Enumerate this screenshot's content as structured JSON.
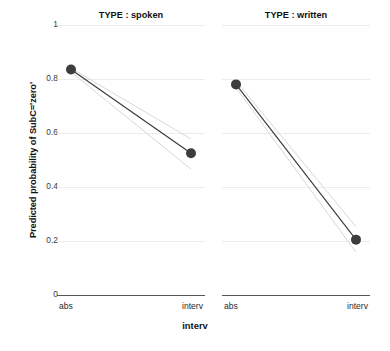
{
  "chart_data": {
    "type": "line",
    "title": "",
    "xlabel": "interv",
    "ylabel": "Predicted probability of SubC='zero'",
    "x": [
      "abs",
      "interv"
    ],
    "categories": [
      "abs",
      "interv"
    ],
    "ylim": [
      0,
      1
    ],
    "yticks": [
      1,
      0.8,
      0.6,
      0.4,
      0.2,
      0
    ],
    "ytick_labels": [
      "1",
      "0.8",
      "0.6",
      "0.4",
      "0.2",
      "0"
    ],
    "grid": true,
    "legend": "none",
    "facet_variable": "TYPE",
    "panels": [
      {
        "key": "spoken",
        "title": "TYPE : spoken",
        "xtick_labels": [
          "abs",
          "interv"
        ],
        "series": [
          {
            "name": "fit",
            "values": [
              0.835,
              0.525
            ]
          },
          {
            "name": "ci_upper",
            "values": [
              0.84,
              0.578
            ]
          },
          {
            "name": "ci_lower",
            "values": [
              0.826,
              0.466
            ]
          }
        ]
      },
      {
        "key": "written",
        "title": "TYPE : written",
        "xtick_labels": [
          "abs",
          "interv"
        ],
        "series": [
          {
            "name": "fit",
            "values": [
              0.78,
              0.205
            ]
          },
          {
            "name": "ci_upper",
            "values": [
              0.792,
              0.253
            ]
          },
          {
            "name": "ci_lower",
            "values": [
              0.768,
              0.158
            ]
          }
        ]
      }
    ],
    "marker": {
      "shape": "circle",
      "color": "#3d3d3d",
      "radius_px": 5
    },
    "colors": {
      "fit_line": "#3a3a3a",
      "ci_line": "#d8d8d8",
      "grid": "#ececec",
      "axis": "#555555",
      "text": "#111111",
      "background": "#ffffff"
    }
  }
}
